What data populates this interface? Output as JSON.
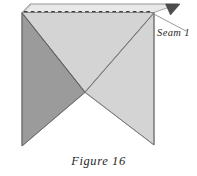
{
  "figure": {
    "caption": "Figure 16",
    "annotation_label": "Seam 1",
    "icons": {
      "leader_line": "leader-line-icon",
      "seam_dashed_line": "dashed-seam-line-icon",
      "corner_notch": "dark-corner-triangle-icon"
    },
    "colors": {
      "background": "#ffffff",
      "fabric_light": "#d4d4d4",
      "fabric_dark": "#9b9b9b",
      "fabric_top_strip": "#e9e9e9",
      "outline": "#6f6f6f",
      "dashed_line": "#4a4a4a",
      "corner_triangle": "#4d4d4d",
      "text": "#222222"
    },
    "geometry": {
      "top_strip_top_y": 4,
      "seam_line_y": 11,
      "seam_line_x_start": 24,
      "seam_line_x_end": 152,
      "left_edge_x": 22,
      "right_edge_x": 154,
      "center_notch_x": 85,
      "center_notch_y": 92,
      "bottom_left_tip_y": 146,
      "bottom_right_tip_y": 145
    },
    "shapes": [
      {
        "name": "left-dark-triangle",
        "shade": "dark",
        "points": "22,14 85,92 22,146"
      },
      {
        "name": "right-light-triangle",
        "shade": "light",
        "points": "154,14 154,145 85,92"
      },
      {
        "name": "upper-light-triangle",
        "shade": "light",
        "points": "22,13 154,13 85,92"
      },
      {
        "name": "top-light-strip",
        "shade": "strip",
        "points": "30,4 178,4 154,13 22,13"
      }
    ]
  }
}
